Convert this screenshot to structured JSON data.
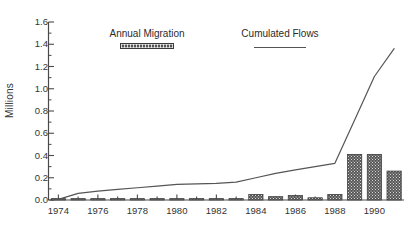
{
  "chart_data": {
    "type": "bar",
    "title": "",
    "subtitle": "",
    "xlabel": "",
    "ylabel": "Millions",
    "xlim": [
      1973.5,
      1991.5
    ],
    "ylim": [
      0.0,
      1.6
    ],
    "grid": false,
    "legend_position": "top-center",
    "y_ticks": [
      "0.0",
      "0.2",
      "0.4",
      "0.6",
      "0.8",
      "1.0",
      "1.2",
      "1.4",
      "1.6"
    ],
    "y_tick_values": [
      0.0,
      0.2,
      0.4,
      0.6,
      0.8,
      1.0,
      1.2,
      1.4,
      1.6
    ],
    "y_minor_tick_values": [
      0.1,
      0.3,
      0.5,
      0.7,
      0.9,
      1.1,
      1.3,
      1.5
    ],
    "x_ticks": [
      "1974",
      "1976",
      "1978",
      "1980",
      "1982",
      "1984",
      "1986",
      "1988",
      "1990"
    ],
    "x_tick_values": [
      1974,
      1976,
      1978,
      1980,
      1982,
      1984,
      1986,
      1988,
      1990
    ],
    "x_minor_tick_values": [
      1975,
      1977,
      1979,
      1981,
      1983,
      1985,
      1987,
      1989,
      1991
    ],
    "categories": [
      1974,
      1975,
      1976,
      1977,
      1978,
      1979,
      1980,
      1981,
      1982,
      1983,
      1984,
      1985,
      1986,
      1987,
      1988,
      1989,
      1990,
      1991
    ],
    "series": [
      {
        "name": "Annual Migration",
        "type": "bar",
        "color": "#555555",
        "pattern": "hatched",
        "values": [
          0.005,
          0.005,
          0.005,
          0.005,
          0.005,
          0.005,
          0.005,
          0.005,
          0.005,
          0.01,
          0.05,
          0.03,
          0.04,
          0.02,
          0.05,
          0.41,
          0.41,
          0.26
        ]
      },
      {
        "name": "Cumulated Flows",
        "type": "line",
        "color": "#555555",
        "values": [
          0.005,
          0.06,
          0.08,
          0.095,
          0.11,
          0.125,
          0.14,
          0.145,
          0.15,
          0.16,
          0.2,
          0.24,
          0.27,
          0.3,
          0.33,
          0.72,
          1.11,
          1.36
        ]
      }
    ]
  },
  "legend": {
    "items": [
      {
        "label": "Annual Migration",
        "swatch": "bar"
      },
      {
        "label": "Cumulated Flows",
        "swatch": "line"
      }
    ]
  },
  "axis": {
    "y_title": "Millions"
  }
}
